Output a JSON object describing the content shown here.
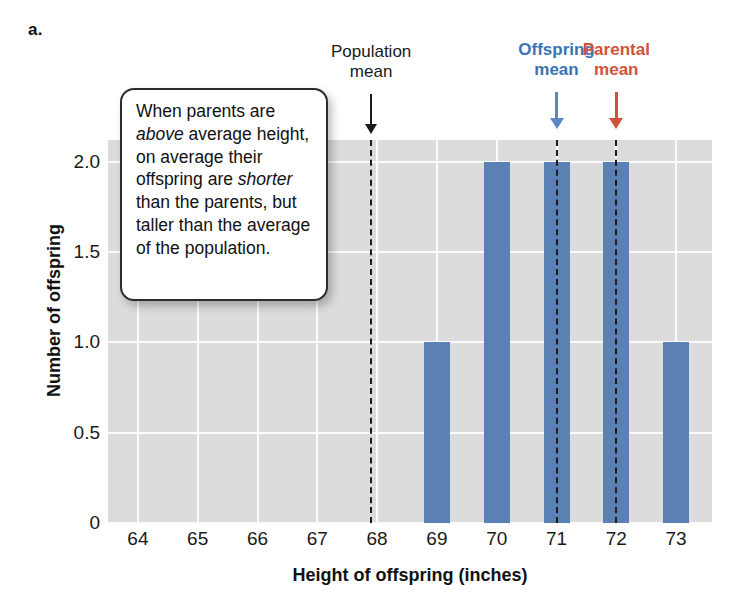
{
  "panel": {
    "letter": "a."
  },
  "callout": {
    "text": "When parents are above average height, on average their offspring are shorter than the parents, but taller than the average of the population.",
    "italic_words": [
      "above",
      "shorter"
    ]
  },
  "annotations": [
    {
      "id": "population-mean",
      "label": "Population\nmean",
      "color": "#1a1a1a",
      "x_value": 67.9,
      "arrow": "down-arrow-icon"
    },
    {
      "id": "offspring-mean",
      "label": "Offspring\nmean",
      "color": "#3a74b4",
      "x_value": 71.0,
      "arrow": "down-arrow-icon"
    },
    {
      "id": "parental-mean",
      "label": "Parental\nmean",
      "color": "#d2513b",
      "x_value": 72.0,
      "arrow": "down-arrow-icon"
    }
  ],
  "chart_data": {
    "type": "bar",
    "title": "",
    "xlabel": "Height of offspring (inches)",
    "ylabel": "Number of offspring",
    "categories": [
      "64",
      "65",
      "66",
      "67",
      "68",
      "69",
      "70",
      "71",
      "72",
      "73"
    ],
    "values": [
      0,
      0,
      0,
      0,
      0,
      1,
      2,
      2,
      2,
      1
    ],
    "xtick_labels": [
      "64",
      "65",
      "66",
      "67",
      "68",
      "69",
      "70",
      "71",
      "72",
      "73"
    ],
    "ytick_labels": [
      "0",
      "0.5",
      "1.0",
      "1.5",
      "2.0"
    ],
    "ytick_values": [
      0,
      0.5,
      1.0,
      1.5,
      2.0
    ],
    "ylim": [
      0,
      2.12
    ],
    "xlim": [
      63.5,
      73.6
    ],
    "grid": true,
    "legend": "none",
    "bar_color": "#5b81b4",
    "plot_background": "#dcdcdc",
    "gridline_color": "#fbfbfb",
    "reference_lines": [
      {
        "name": "population-mean-line",
        "x_value": 67.9,
        "style": "dashed",
        "color": "#1c1c1c"
      },
      {
        "name": "offspring-mean-line",
        "x_value": 71.0,
        "style": "dashed",
        "color": "#1c1c1c"
      },
      {
        "name": "parental-mean-line",
        "x_value": 72.0,
        "style": "dashed",
        "color": "#1c1c1c"
      }
    ],
    "annotation_text": "When parents are above average height, on average their offspring are shorter than the parents, but taller than the average of the population."
  }
}
